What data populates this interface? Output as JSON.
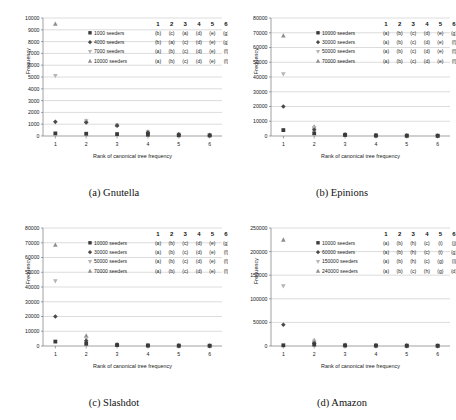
{
  "figure": {
    "panels": [
      {
        "caption": "(a) Gnutella",
        "xlabel": "Rank of canonical tree frequency",
        "ylabel": "Frequency",
        "xticks": [
          "1",
          "2",
          "3",
          "4",
          "5",
          "6"
        ],
        "yticks": [
          "0",
          "1000",
          "2000",
          "3000",
          "4000",
          "5000",
          "6000",
          "7000",
          "8000",
          "9000",
          "10000"
        ],
        "legend_header": [
          "1",
          "2",
          "3",
          "4",
          "5",
          "6"
        ],
        "legend_rows": [
          {
            "marker": "square",
            "label": "1000 seeders",
            "letters": [
              "(b)",
              "(c)",
              "(a)",
              "(d)",
              "(e)",
              "(g)"
            ]
          },
          {
            "marker": "diamond",
            "label": "4000 seeders",
            "letters": [
              "(b)",
              "(a)",
              "(c)",
              "(d)",
              "(e)",
              "(g)"
            ]
          },
          {
            "marker": "triangle-down",
            "label": "7000 seeders",
            "letters": [
              "(a)",
              "(b)",
              "(c)",
              "(d)",
              "(e)",
              "(f)"
            ]
          },
          {
            "marker": "triangle-up",
            "label": "10000 seeders",
            "letters": [
              "(a)",
              "(b)",
              "(c)",
              "(d)",
              "(e)",
              "(f)"
            ]
          }
        ]
      },
      {
        "caption": "(b) Epinions",
        "xlabel": "Rank of canonical tree frequency",
        "ylabel": "Frequency",
        "xticks": [
          "1",
          "2",
          "3",
          "4",
          "5",
          "6"
        ],
        "yticks": [
          "0",
          "10000",
          "20000",
          "30000",
          "40000",
          "50000",
          "60000",
          "70000",
          "80000"
        ],
        "legend_header": [
          "1",
          "2",
          "3",
          "4",
          "5",
          "6"
        ],
        "legend_rows": [
          {
            "marker": "square",
            "label": "10000 seeders",
            "letters": [
              "(a)",
              "(b)",
              "(c)",
              "(d)",
              "(e)",
              "(g)"
            ]
          },
          {
            "marker": "diamond",
            "label": "30000 seeders",
            "letters": [
              "(a)",
              "(b)",
              "(c)",
              "(d)",
              "(e)",
              "(f)"
            ]
          },
          {
            "marker": "triangle-down",
            "label": "50000 seeders",
            "letters": [
              "(a)",
              "(b)",
              "(c)",
              "(d)",
              "(e)",
              "(f)"
            ]
          },
          {
            "marker": "triangle-up",
            "label": "70000 seeders",
            "letters": [
              "(a)",
              "(b)",
              "(c)",
              "(d)",
              "(e)",
              "(f)"
            ]
          }
        ]
      },
      {
        "caption": "(c) Slashdot",
        "xlabel": "Rank of canonical tree frequency",
        "ylabel": "Frequency",
        "xticks": [
          "1",
          "2",
          "3",
          "4",
          "5",
          "6"
        ],
        "yticks": [
          "0",
          "10000",
          "20000",
          "30000",
          "40000",
          "50000",
          "60000",
          "70000",
          "80000"
        ],
        "legend_header": [
          "1",
          "2",
          "3",
          "4",
          "5",
          "6"
        ],
        "legend_rows": [
          {
            "marker": "square",
            "label": "10000 seeders",
            "letters": [
              "(a)",
              "(b)",
              "(c)",
              "(d)",
              "(e)",
              "(g)"
            ]
          },
          {
            "marker": "diamond",
            "label": "30000 seeders",
            "letters": [
              "(a)",
              "(b)",
              "(c)",
              "(d)",
              "(e)",
              "(f)"
            ]
          },
          {
            "marker": "triangle-down",
            "label": "50000 seeders",
            "letters": [
              "(a)",
              "(b)",
              "(c)",
              "(d)",
              "(e)",
              "(f)"
            ]
          },
          {
            "marker": "triangle-up",
            "label": "70000 seeders",
            "letters": [
              "(a)",
              "(b)",
              "(c)",
              "(d)",
              "(e)",
              "(f)"
            ]
          }
        ]
      },
      {
        "caption": "(d) Amazon",
        "xlabel": "Rank of canonical tree frequency",
        "ylabel": "Frequency",
        "xticks": [
          "1",
          "2",
          "3",
          "4",
          "5",
          "6"
        ],
        "yticks": [
          "0",
          "50000",
          "100000",
          "150000",
          "200000",
          "250000"
        ],
        "legend_header": [
          "1",
          "2",
          "3",
          "4",
          "5",
          "6"
        ],
        "legend_rows": [
          {
            "marker": "square",
            "label": "10000 seeders",
            "letters": [
              "(a)",
              "(b)",
              "(h)",
              "(c)",
              "(i)",
              "(j)"
            ]
          },
          {
            "marker": "diamond",
            "label": "60000 seeders",
            "letters": [
              "(a)",
              "(b)",
              "(h)",
              "(c)",
              "(i)",
              "(g)"
            ]
          },
          {
            "marker": "triangle-down",
            "label": "150000 seeders",
            "letters": [
              "(a)",
              "(b)",
              "(h)",
              "(c)",
              "(g)",
              "(l)"
            ]
          },
          {
            "marker": "triangle-up",
            "label": "240000 seeders",
            "letters": [
              "(a)",
              "(b)",
              "(c)",
              "(h)",
              "(g)",
              "(d)"
            ]
          }
        ]
      }
    ]
  },
  "chart_data": [
    {
      "type": "scatter",
      "title": "(a) Gnutella",
      "xlabel": "Rank of canonical tree frequency",
      "ylabel": "Frequency",
      "x": [
        1,
        2,
        3,
        4,
        5,
        6
      ],
      "xlim": [
        0.6,
        6.4
      ],
      "ylim": [
        0,
        10000
      ],
      "ytick_step": 1000,
      "grid": true,
      "legend_position": "upper-right",
      "series": [
        {
          "name": "1000 seeders",
          "marker": "square",
          "values": [
            220,
            190,
            160,
            110,
            60,
            40
          ]
        },
        {
          "name": "4000 seeders",
          "marker": "diamond",
          "values": [
            1200,
            1150,
            880,
            300,
            120,
            70
          ]
        },
        {
          "name": "7000 seeders",
          "marker": "triangle-down",
          "values": [
            5100,
            1250,
            900,
            330,
            140,
            80
          ]
        },
        {
          "name": "10000 seeders",
          "marker": "triangle-up",
          "values": [
            9500,
            1300,
            930,
            360,
            150,
            90
          ]
        }
      ]
    },
    {
      "type": "scatter",
      "title": "(b) Epinions",
      "xlabel": "Rank of canonical tree frequency",
      "ylabel": "Frequency",
      "x": [
        1,
        2,
        3,
        4,
        5,
        6
      ],
      "xlim": [
        0.6,
        6.4
      ],
      "ylim": [
        0,
        80000
      ],
      "ytick_step": 10000,
      "grid": true,
      "legend_position": "upper-right",
      "series": [
        {
          "name": "10000 seeders",
          "marker": "square",
          "values": [
            4000,
            1800,
            700,
            300,
            200,
            150
          ]
        },
        {
          "name": "30000 seeders",
          "marker": "diamond",
          "values": [
            20000,
            4200,
            900,
            400,
            250,
            180
          ]
        },
        {
          "name": "50000 seeders",
          "marker": "triangle-down",
          "values": [
            42000,
            5500,
            1000,
            450,
            280,
            200
          ]
        },
        {
          "name": "70000 seeders",
          "marker": "triangle-up",
          "values": [
            68000,
            6300,
            1100,
            500,
            300,
            220
          ]
        }
      ]
    },
    {
      "type": "scatter",
      "title": "(c) Slashdot",
      "xlabel": "Rank of canonical tree frequency",
      "ylabel": "Frequency",
      "x": [
        1,
        2,
        3,
        4,
        5,
        6
      ],
      "xlim": [
        0.6,
        6.4
      ],
      "ylim": [
        0,
        80000
      ],
      "ytick_step": 10000,
      "grid": true,
      "legend_position": "upper-right",
      "series": [
        {
          "name": "10000 seeders",
          "marker": "square",
          "values": [
            3000,
            1500,
            600,
            300,
            200,
            150
          ]
        },
        {
          "name": "30000 seeders",
          "marker": "diamond",
          "values": [
            20000,
            3500,
            800,
            380,
            240,
            170
          ]
        },
        {
          "name": "50000 seeders",
          "marker": "triangle-down",
          "values": [
            44000,
            5000,
            950,
            430,
            270,
            190
          ]
        },
        {
          "name": "70000 seeders",
          "marker": "triangle-up",
          "values": [
            68500,
            7000,
            1050,
            480,
            290,
            210
          ]
        }
      ]
    },
    {
      "type": "scatter",
      "title": "(d) Amazon",
      "xlabel": "Rank of canonical tree frequency",
      "ylabel": "Frequency",
      "x": [
        1,
        2,
        3,
        4,
        5,
        6
      ],
      "xlim": [
        0.6,
        6.4
      ],
      "ylim": [
        0,
        250000
      ],
      "ytick_step": 50000,
      "grid": true,
      "legend_position": "upper-right",
      "series": [
        {
          "name": "10000 seeders",
          "marker": "square",
          "values": [
            1500,
            3000,
            1000,
            800,
            500,
            400
          ]
        },
        {
          "name": "60000 seeders",
          "marker": "diamond",
          "values": [
            45000,
            6000,
            1500,
            1000,
            700,
            500
          ]
        },
        {
          "name": "150000 seeders",
          "marker": "triangle-down",
          "values": [
            127000,
            9000,
            2000,
            1200,
            800,
            600
          ]
        },
        {
          "name": "240000 seeders",
          "marker": "triangle-up",
          "values": [
            225000,
            12000,
            2500,
            1400,
            900,
            700
          ]
        }
      ]
    }
  ]
}
